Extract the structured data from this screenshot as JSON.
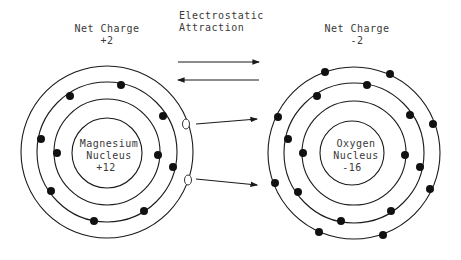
{
  "left_atom": {
    "net_charge_label": "Net Charge",
    "net_charge_value": "+2",
    "nucleus_line1": "Magnesium",
    "nucleus_line2": "Nucleus",
    "nucleus_charge": "+12",
    "shells": [
      2,
      8
    ],
    "lost_electrons": 2
  },
  "right_atom": {
    "net_charge_label": "Net Charge",
    "net_charge_value": "-2",
    "nucleus_line1": "Oxygen",
    "nucleus_line2": "Nucleus",
    "nucleus_charge": "-16",
    "shells": [
      2,
      8,
      8
    ]
  },
  "center": {
    "label_line1": "Electrostatic",
    "label_line2": "Attraction"
  },
  "colors": {
    "line": "#1a1a1a",
    "electron": "#111111",
    "text": "#3a3a3a"
  }
}
